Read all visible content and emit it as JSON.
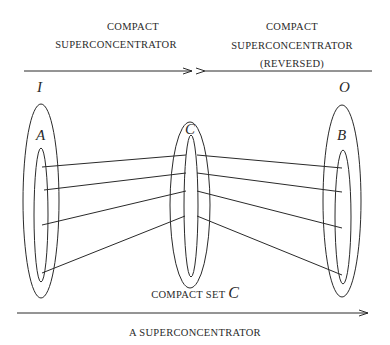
{
  "diagram": {
    "top_left_label": {
      "line1": "COMPACT",
      "line2": "SUPERCONCENTRATOR"
    },
    "top_right_label": {
      "line1": "COMPACT",
      "line2": "SUPERCONCENTRATOR",
      "line3": "(REVERSED)"
    },
    "bottom_label": "A SUPERCONCENTRATOR",
    "center_label": {
      "prefix": "COMPACT SET ",
      "var": "C"
    },
    "sets": {
      "input": "I",
      "output": "O",
      "left_subset": "A",
      "center_subset": "C",
      "right_subset": "B"
    },
    "arrows": [
      {
        "name": "compact-superconcentrator-arrow",
        "direction": "right"
      },
      {
        "name": "reversed-arrow",
        "direction": "left"
      },
      {
        "name": "superconcentrator-arrow",
        "direction": "right"
      }
    ],
    "connections_left": [
      {
        "from": [
          42,
          167
        ],
        "to": [
          186,
          155
        ]
      },
      {
        "from": [
          44,
          190
        ],
        "to": [
          186,
          173
        ]
      },
      {
        "from": [
          42,
          225
        ],
        "to": [
          186,
          191
        ]
      },
      {
        "from": [
          42,
          273
        ],
        "to": [
          185,
          216
        ]
      }
    ],
    "connections_right": [
      {
        "from": [
          197,
          155
        ],
        "to": [
          342,
          168
        ]
      },
      {
        "from": [
          197,
          173
        ],
        "to": [
          342,
          192
        ]
      },
      {
        "from": [
          197,
          191
        ],
        "to": [
          342,
          228
        ]
      },
      {
        "from": [
          197,
          216
        ],
        "to": [
          342,
          275
        ]
      }
    ],
    "colors": {
      "ink": "#2a2a2a",
      "background": "#ffffff"
    }
  }
}
